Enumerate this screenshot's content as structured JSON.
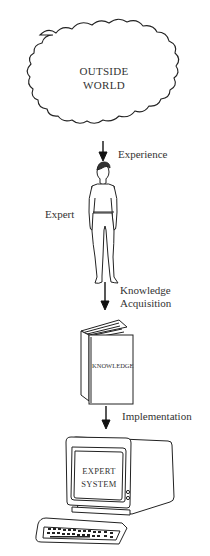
{
  "diagram": {
    "nodes": [
      {
        "id": "outside-world",
        "label": "OUTSIDE\nWORLD",
        "line1": "OUTSIDE",
        "line2": "WORLD",
        "shape": "cloud-icon"
      },
      {
        "id": "expert",
        "label": "Expert",
        "shape": "person-icon"
      },
      {
        "id": "knowledge",
        "label": "KNOWLEDGE",
        "shape": "book-icon"
      },
      {
        "id": "expert-system",
        "label": "EXPERT SYSTEM",
        "line1": "EXPERT",
        "line2": "SYSTEM",
        "shape": "computer-terminal-icon"
      }
    ],
    "edges": [
      {
        "from": "outside-world",
        "to": "expert",
        "label": "Experience"
      },
      {
        "from": "expert",
        "to": "knowledge",
        "label_line1": "Knowledge",
        "label_line2": "Acquisition"
      },
      {
        "from": "knowledge",
        "to": "expert-system",
        "label": "Implementation"
      }
    ]
  }
}
